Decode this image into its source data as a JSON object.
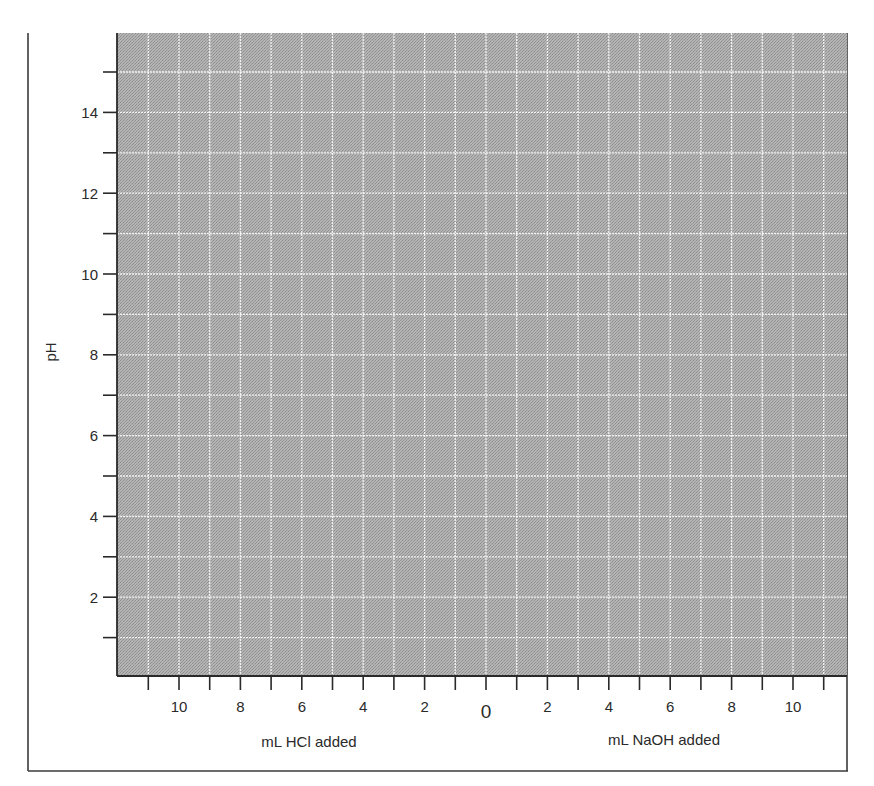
{
  "chart_data": {
    "type": "line",
    "title": "",
    "xlabel_left": "mL HCl added",
    "xlabel_right": "mL NaOH added",
    "ylabel": "pH",
    "x_axis": {
      "description": "Diverging axis: mL HCl added to the left of 0, mL NaOH added to the right of 0",
      "range": [
        -12,
        12
      ],
      "minor_tick_step": 1,
      "tick_positions": [
        -11,
        -10,
        -9,
        -8,
        -7,
        -6,
        -5,
        -4,
        -3,
        -2,
        -1,
        0,
        1,
        2,
        3,
        4,
        5,
        6,
        7,
        8,
        9,
        10,
        11
      ],
      "labeled_ticks": [
        {
          "value": -10,
          "label": "10"
        },
        {
          "value": -8,
          "label": "8"
        },
        {
          "value": -6,
          "label": "6"
        },
        {
          "value": -4,
          "label": "4"
        },
        {
          "value": -2,
          "label": "2"
        },
        {
          "value": 0,
          "label": "0"
        },
        {
          "value": 2,
          "label": "2"
        },
        {
          "value": 4,
          "label": "4"
        },
        {
          "value": 6,
          "label": "6"
        },
        {
          "value": 8,
          "label": "8"
        },
        {
          "value": 10,
          "label": "10"
        }
      ]
    },
    "y_axis": {
      "range": [
        0,
        16
      ],
      "minor_tick_step": 1,
      "tick_positions": [
        1,
        2,
        3,
        4,
        5,
        6,
        7,
        8,
        9,
        10,
        11,
        12,
        13,
        14,
        15
      ],
      "labeled_ticks": [
        2,
        4,
        6,
        8,
        10,
        12,
        14
      ]
    },
    "grid": true,
    "grid_style": "white lines on halftone gray",
    "series": [],
    "legend": null,
    "note": "Blank graph-paper template; no data plotted"
  },
  "labels": {
    "ylabel": "pH",
    "xlabel_left": "mL HCl added",
    "xlabel_right": "mL NaOH added"
  },
  "colors": {
    "plot_fill": "#a9a9a9",
    "grid_line": "#ffffff",
    "axis_line": "#2a2a2a",
    "frame_line": "#3a3a3a"
  }
}
